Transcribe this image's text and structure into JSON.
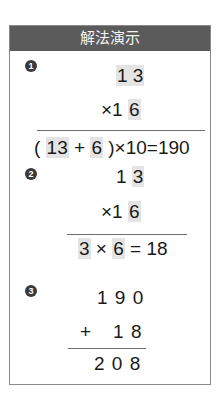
{
  "panel": {
    "title": "解法演示"
  },
  "steps": [
    {
      "badge": "1",
      "lines": {
        "top_a": "1",
        "top_b": "3",
        "mul_sign": "×",
        "mul_a": "1",
        "mul_b": "6",
        "res_open": "(",
        "res_hl1": "13",
        "res_plus": "+",
        "res_hl2": "6",
        "res_rest": ")×10=190"
      }
    },
    {
      "badge": "2",
      "lines": {
        "top_a": "1",
        "top_b": "3",
        "mul_sign": "×",
        "mul_a": "1",
        "mul_b": "6",
        "res_hl1": "3",
        "res_times": "×",
        "res_hl2": "6",
        "res_rest": "= 18"
      }
    },
    {
      "badge": "3",
      "lines": {
        "top": "1 9 0",
        "add_sign": "+",
        "add_num": "1 8",
        "result": "2 0 8"
      }
    }
  ]
}
